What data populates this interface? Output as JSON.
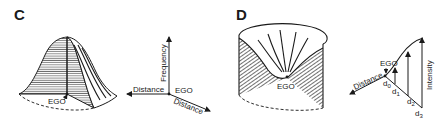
{
  "panels": [
    {
      "id": "C",
      "label": "C",
      "surface_label": "EGO",
      "axes": {
        "vertical": "Frequency",
        "left": "Distance",
        "diagonal": "Distance",
        "origin": "EGO"
      }
    },
    {
      "id": "D",
      "label": "D",
      "surface_label": "EGO",
      "axes": {
        "vertical": "Intensity",
        "left": "Distance",
        "origin": "EGO",
        "distance_marks": [
          "d",
          "d",
          "d",
          "d"
        ],
        "distance_subscripts": [
          "0",
          "1",
          "2",
          "3"
        ]
      }
    }
  ]
}
